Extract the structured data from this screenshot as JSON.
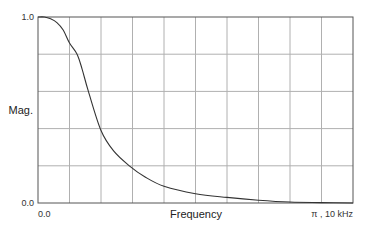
{
  "chart_data": {
    "type": "line",
    "title": "",
    "xlabel": "Frequency",
    "ylabel": "Mag.",
    "xlim": [
      0,
      1
    ],
    "ylim": [
      0,
      1
    ],
    "grid": true,
    "grid_divisions": {
      "x": 10,
      "y": 5
    },
    "y_tick_labels": {
      "bottom": "0.0",
      "top": "1.0"
    },
    "x_tick_labels": {
      "left": "0.0",
      "right": "π , 10 kHz"
    },
    "colors": {
      "grid": "#b0b0b0",
      "frame": "#555555",
      "curve": "#333333"
    },
    "series": [
      {
        "name": "Magnitude response",
        "x": [
          0.0,
          0.02,
          0.04,
          0.06,
          0.08,
          0.1,
          0.124,
          0.14,
          0.16,
          0.2,
          0.24,
          0.29,
          0.34,
          0.4,
          0.5,
          0.6,
          0.7,
          0.8,
          0.9,
          1.0
        ],
        "y": [
          1.0,
          1.0,
          0.99,
          0.97,
          0.93,
          0.86,
          0.8,
          0.72,
          0.6,
          0.39,
          0.28,
          0.2,
          0.14,
          0.09,
          0.05,
          0.03,
          0.015,
          0.005,
          0.002,
          0.0
        ]
      }
    ]
  }
}
